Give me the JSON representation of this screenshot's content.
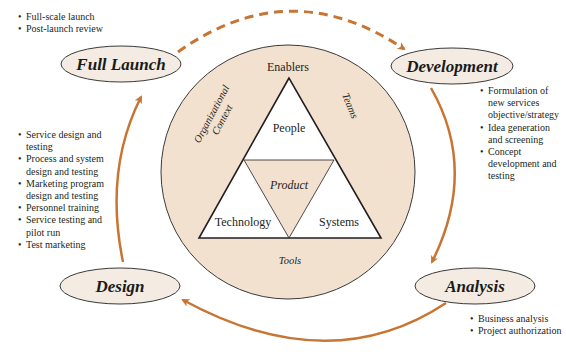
{
  "colors": {
    "arrow": "#c87533",
    "circle_fill": "#f3e1cf",
    "ellipse_fill": "#f4ece2",
    "outline": "#3a3a3a",
    "triangle_fill": "#ffffff"
  },
  "stages": {
    "full_launch": {
      "label": "Full Launch",
      "bullets": [
        "Full-scale launch",
        "Post-launch review"
      ]
    },
    "development": {
      "label": "Development",
      "bullets": [
        "Formulation of new services objective/strategy",
        "Idea generation and screening",
        "Concept development and testing"
      ]
    },
    "analysis": {
      "label": "Analysis",
      "bullets": [
        "Business analysis",
        "Project authorization"
      ]
    },
    "design": {
      "label": "Design",
      "bullets": [
        "Service design and testing",
        "Process and system design and testing",
        "Marketing program design and testing",
        "Personnel training",
        "Service testing and pilot run",
        "Test marketing"
      ]
    }
  },
  "center": {
    "enablers": "Enablers",
    "people": "People",
    "product": "Product",
    "technology": "Technology",
    "systems": "Systems",
    "tools": "Tools",
    "teams": "Teams",
    "org_context_line1": "Organizational",
    "org_context_line2": "Context"
  },
  "arrows": [
    {
      "from": "Full Launch",
      "to": "Development",
      "style": "dashed"
    },
    {
      "from": "Development",
      "to": "Analysis",
      "style": "solid"
    },
    {
      "from": "Analysis",
      "to": "Design",
      "style": "solid"
    },
    {
      "from": "Design",
      "to": "Full Launch",
      "style": "solid"
    }
  ]
}
